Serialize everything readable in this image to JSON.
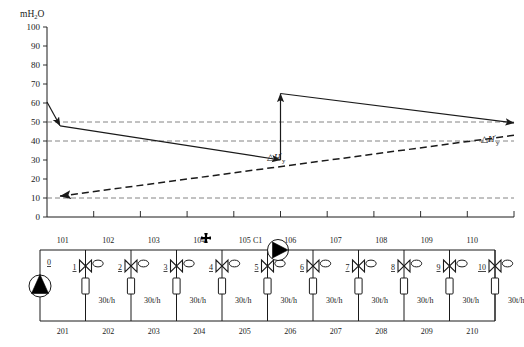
{
  "chart_data": {
    "type": "line",
    "title": "",
    "ylabel": "mH2O",
    "xlabel": "",
    "ylim": [
      0,
      100
    ],
    "yticks": [
      0,
      10,
      20,
      30,
      40,
      50,
      60,
      70,
      80,
      90,
      100
    ],
    "ytick_labels": [
      "0",
      "10",
      "20",
      "30",
      "40",
      "50",
      "60",
      "70",
      "80",
      "90",
      "100"
    ],
    "grid": false,
    "xlim": [
      0,
      10
    ],
    "xticks": [
      1,
      2,
      3,
      4,
      5,
      6,
      7,
      8,
      9,
      10
    ],
    "xtick_labels": [
      "",
      "",
      "",
      "",
      "",
      "",
      "",
      "",
      "",
      ""
    ],
    "reference_lines": [
      {
        "name": "ref-50",
        "y": 50,
        "style": "dashed"
      },
      {
        "name": "ref-40",
        "y": 40,
        "style": "dashed"
      },
      {
        "name": "ref-10",
        "y": 10,
        "style": "dashed"
      }
    ],
    "series": [
      {
        "name": "supply-head-upstream",
        "style": "solid",
        "arrow": "end",
        "points": [
          [
            0.0,
            60.5
          ],
          [
            0.28,
            48.0
          ]
        ]
      },
      {
        "name": "supply-head-segment-a",
        "style": "solid",
        "arrow": "end",
        "points": [
          [
            0.28,
            48.0
          ],
          [
            5.0,
            30.0
          ]
        ]
      },
      {
        "name": "booster-pump-rise",
        "style": "solid",
        "arrow": "end",
        "points": [
          [
            5.0,
            30.0
          ],
          [
            5.0,
            65.0
          ]
        ]
      },
      {
        "name": "supply-head-segment-b",
        "style": "solid",
        "arrow": "end",
        "points": [
          [
            5.0,
            65.0
          ],
          [
            10.0,
            49.5
          ]
        ]
      },
      {
        "name": "return-head-line",
        "style": "dashed",
        "arrow": "end",
        "points": [
          [
            10.0,
            43.0
          ],
          [
            0.28,
            11.0
          ]
        ]
      }
    ],
    "annotations": [
      {
        "name": "delta-h-mid",
        "text": "△H'y",
        "x": 5.35,
        "y": 28.5
      },
      {
        "name": "delta-h-right",
        "text": "△H'y",
        "x": 10.15,
        "y": 44.0
      }
    ]
  },
  "axis": {
    "unit": "mH2O",
    "unit_main": "mH",
    "unit_sub": "2",
    "unit_tail": "O"
  },
  "delta": {
    "tri": "△",
    "h": "H",
    "prime": "′",
    "sub": "y"
  },
  "network": {
    "source_pump": {
      "label": "0",
      "icon": "pump-up-icon"
    },
    "booster_pump": {
      "label": "C1",
      "icon": "pump-right-icon"
    },
    "cross_marker": {
      "icon": "cross-marker-icon",
      "after_node": "104"
    },
    "top_nodes": [
      "101",
      "102",
      "103",
      "104",
      "105",
      "106",
      "107",
      "108",
      "109",
      "110"
    ],
    "bottom_nodes": [
      "201",
      "202",
      "203",
      "204",
      "205",
      "206",
      "207",
      "208",
      "209",
      "210"
    ],
    "valves": [
      {
        "number": "1",
        "flow": "30t/h"
      },
      {
        "number": "2",
        "flow": "30t/h"
      },
      {
        "number": "3",
        "flow": "30t/h"
      },
      {
        "number": "4",
        "flow": "30t/h"
      },
      {
        "number": "5",
        "flow": "30t/h"
      },
      {
        "number": "6",
        "flow": "30t/h"
      },
      {
        "number": "7",
        "flow": "30t/h"
      },
      {
        "number": "8",
        "flow": "30t/h"
      },
      {
        "number": "9",
        "flow": "30t/h"
      },
      {
        "number": "10",
        "flow": "30t/h"
      }
    ]
  },
  "colors": {
    "line": "#1a1a1a",
    "reference": "#555555",
    "fill_black": "#000000",
    "background": "#ffffff"
  }
}
